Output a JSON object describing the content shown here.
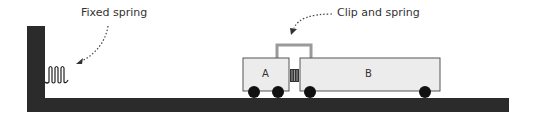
{
  "labels": {
    "fixed_spring": "Fixed spring",
    "clip_and_spring": "Clip and spring",
    "cart_a": "A",
    "cart_b": "B"
  },
  "colors": {
    "ground": "#2b2b2b",
    "cart_fill": "#ececec",
    "cart_stroke": "#555555",
    "clip": "#9a9a9a",
    "wheel": "#111111"
  }
}
